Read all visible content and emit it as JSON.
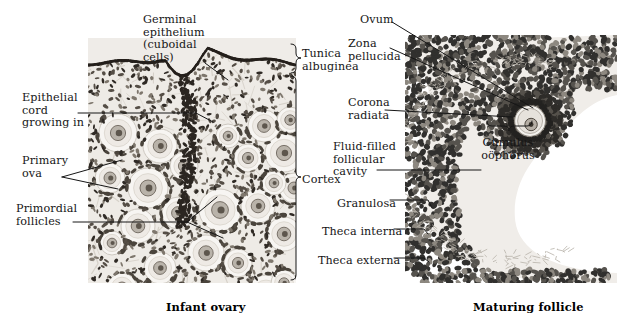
{
  "figure": {
    "background": "#ffffff",
    "ink": "#161616",
    "panels": [
      {
        "name": "infant-ovary",
        "caption": "Infant ovary",
        "caption_x": 166,
        "caption_y": 300,
        "x": 88,
        "y": 38,
        "w": 208,
        "h": 245
      },
      {
        "name": "maturing-follicle",
        "caption": "Maturing follicle",
        "caption_x": 473,
        "caption_y": 300,
        "x": 405,
        "y": 35,
        "w": 212,
        "h": 248
      }
    ],
    "labels": [
      {
        "name": "germinal-epithelium",
        "text": "Germinal\nepithelium\n(cuboidal\ncells)",
        "x": 143,
        "y": 14,
        "align": "left"
      },
      {
        "name": "epithelial-cord",
        "text": "Epithelial\ncord\ngrowing in",
        "x": 22,
        "y": 92,
        "align": "left"
      },
      {
        "name": "primary-ova",
        "text": "Primary\nova",
        "x": 22,
        "y": 155,
        "align": "left"
      },
      {
        "name": "primordial-follicles",
        "text": "Primordial\nfollicles",
        "x": 16,
        "y": 203,
        "align": "left"
      },
      {
        "name": "tunica-albuginea",
        "text": "Tunica\nalbuginea",
        "x": 302,
        "y": 48,
        "align": "left"
      },
      {
        "name": "cortex",
        "text": "Cortex",
        "x": 302,
        "y": 174,
        "align": "left"
      },
      {
        "name": "ovum",
        "text": "Ovum",
        "x": 360,
        "y": 14,
        "align": "left"
      },
      {
        "name": "zona-pellucida",
        "text": "Zona\npellucida",
        "x": 348,
        "y": 38,
        "align": "left"
      },
      {
        "name": "corona-radiata",
        "text": "Corona\nradiata",
        "x": 348,
        "y": 97,
        "align": "left"
      },
      {
        "name": "fluid-filled-cavity",
        "text": "Fluid-filled\nfollicular\ncavity",
        "x": 333,
        "y": 141,
        "align": "left"
      },
      {
        "name": "granulosa",
        "text": "Granulosa",
        "x": 337,
        "y": 198,
        "align": "left"
      },
      {
        "name": "theca-interna",
        "text": "Theca interna",
        "x": 322,
        "y": 226,
        "align": "left"
      },
      {
        "name": "theca-externa",
        "text": "Theca externa",
        "x": 318,
        "y": 255,
        "align": "left"
      },
      {
        "name": "cumulus-oophorus",
        "text": "Cumulus\noöphorus",
        "x": 508,
        "y": 137,
        "align": "center"
      }
    ],
    "leader_lines": [
      {
        "name": "leader-germinal-epithelium",
        "points": "205,63 228,80"
      },
      {
        "name": "leader-epithelial-cord",
        "points": "78,113 196,113 213,122"
      },
      {
        "name": "leader-primary-ova",
        "points": "62,177 122,160"
      },
      {
        "name": "leader-primary-ova-2",
        "points": "62,177 118,189"
      },
      {
        "name": "leader-primordial-1",
        "points": "73,222 187,222 217,197"
      },
      {
        "name": "leader-primordial-2",
        "points": "187,222 223,238"
      },
      {
        "name": "leader-ovum",
        "points": "392,22 533,108"
      },
      {
        "name": "leader-zona-pellucida",
        "points": "390,48 528,110"
      },
      {
        "name": "leader-corona-radiata",
        "points": "385,110 512,117"
      },
      {
        "name": "leader-fluid-cavity",
        "points": "377,170 481,170"
      },
      {
        "name": "leader-granulosa",
        "points": "390,200 428,200 432,208"
      },
      {
        "name": "leader-theca-interna",
        "points": "394,229 424,229 428,234"
      },
      {
        "name": "leader-theca-externa",
        "points": "394,258 424,258 429,262"
      }
    ],
    "brackets": [
      {
        "name": "bracket-tunica-albuginea",
        "x": 296,
        "y_top": 44,
        "y_bottom": 73,
        "tip_y": 58
      },
      {
        "name": "bracket-cortex",
        "x": 296,
        "y_top": 76,
        "y_bottom": 280,
        "tip_y": 177
      },
      {
        "name": "bracket-cumulus",
        "x1": 487,
        "x2": 532,
        "y": 126,
        "tip_x": 509
      }
    ]
  }
}
